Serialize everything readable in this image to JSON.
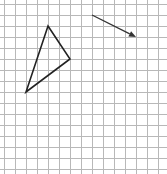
{
  "figure": {
    "grid": {
      "origin_px": [
        4,
        4
      ],
      "cell_px": 11,
      "columns": 15,
      "rows": 15,
      "line_color": "#b8b8b8"
    },
    "triangle": {
      "vertices_grid": [
        [
          4,
          2
        ],
        [
          6,
          5
        ],
        [
          2,
          8
        ]
      ],
      "stroke_color": "#222222"
    },
    "vector": {
      "from_grid": [
        8,
        1
      ],
      "to_grid": [
        12,
        3
      ],
      "stroke_color": "#333333"
    }
  }
}
